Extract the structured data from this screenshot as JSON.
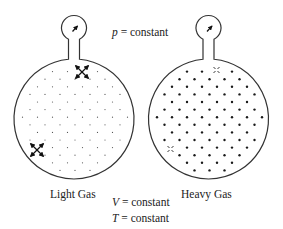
{
  "diagram": {
    "title_equation": {
      "variable": "p",
      "rest": " = constant"
    },
    "flasks": [
      {
        "id": "light",
        "label": "Light Gas",
        "particle_style": "small-light-dots",
        "particle_color": "#555555",
        "collision_markers": "double-headed-arrows"
      },
      {
        "id": "heavy",
        "label": "Heavy Gas",
        "particle_style": "large-dark-dots",
        "particle_color": "#1a1a1a",
        "collision_markers": "x-marks"
      }
    ],
    "conditions": [
      {
        "variable": "V",
        "rest": " = constant"
      },
      {
        "variable": "T",
        "rest": " = constant"
      }
    ],
    "gauge_icon": "pressure-gauge-needle",
    "stroke_color": "#333333"
  }
}
